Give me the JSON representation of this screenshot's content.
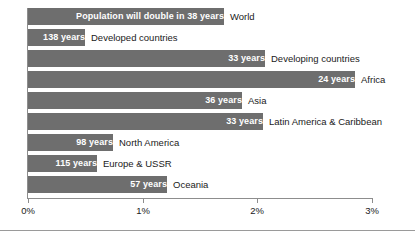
{
  "chart_data": {
    "type": "bar",
    "orientation": "horizontal",
    "title": "",
    "xlabel": "",
    "ylabel": "",
    "xlim": [
      0,
      3
    ],
    "grid": false,
    "legend": null,
    "axis_tick_labels": [
      "0%",
      "1%",
      "2%",
      "3%"
    ],
    "axis_tick_values": [
      0,
      1,
      2,
      3
    ],
    "value_unit": "%",
    "bar_color": "#6e6e6e",
    "bar_label_color": "#ffffff",
    "category_label_color": "#1a1a1a",
    "axis_color": "#8d8d8d",
    "categories": [
      "World",
      "Developed countries",
      "Developing countries",
      "Africa",
      "Asia",
      "Latin America & Caribbean",
      "North America",
      "Europe & USSR",
      "Oceania"
    ],
    "values": [
      1.71,
      0.5,
      2.07,
      2.85,
      1.87,
      2.05,
      0.74,
      0.6,
      1.21
    ],
    "bar_labels": [
      "Population will double in 38 years",
      "138 years",
      "33 years",
      "24 years",
      "36 years",
      "33 years",
      "98 years",
      "115 years",
      "57 years"
    ],
    "doubling_years": [
      38,
      138,
      33,
      24,
      36,
      33,
      98,
      115,
      57
    ],
    "annotations": [
      "Population will double in 38 years"
    ]
  }
}
